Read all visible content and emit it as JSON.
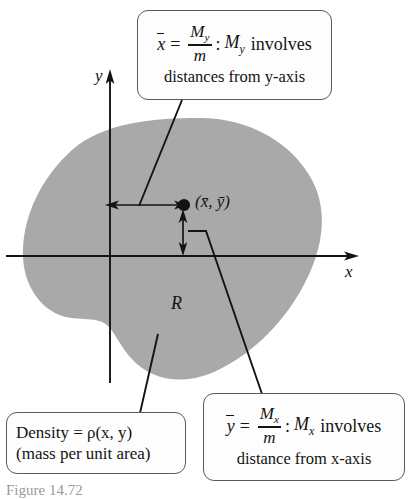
{
  "figure": {
    "caption": "Figure 14.72",
    "region_label": "R",
    "axis_labels": {
      "x": "x",
      "y": "y"
    },
    "centroid_label": "(x̄, ȳ)",
    "shading_color": "#a9a9a9",
    "line_color": "#141414",
    "box_border_color": "#5a5a5a",
    "box_fill_color": "#fdfdfd"
  },
  "callouts": {
    "xbar": {
      "var": "x",
      "equals": "=",
      "numerator": "M",
      "numerator_sub": "y",
      "denominator": "m",
      "colon": ":",
      "term": "M",
      "term_sub": "y",
      "involves": "involves",
      "second_line": "distances from y-axis"
    },
    "ybar": {
      "var": "y",
      "equals": "=",
      "numerator": "M",
      "numerator_sub": "x",
      "denominator": "m",
      "colon": ":",
      "term": "M",
      "term_sub": "x",
      "involves": "involves",
      "second_line": "distance from x-axis"
    },
    "density": {
      "line1": "Density = ρ(x, y)",
      "line2": "(mass per unit area)"
    }
  }
}
